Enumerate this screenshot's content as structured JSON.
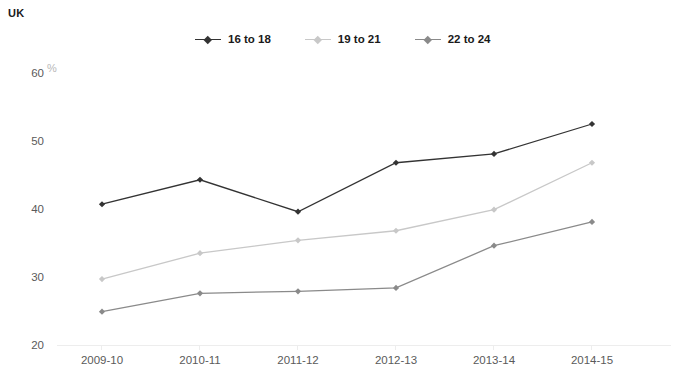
{
  "region": {
    "label": "UK"
  },
  "axis": {
    "unit_label": "%"
  },
  "legend": {
    "items": [
      {
        "label": "16 to 18",
        "color": "#333333"
      },
      {
        "label": "19 to 21",
        "color": "#c8c8c8"
      },
      {
        "label": "22 to 24",
        "color": "#8a8a8a"
      }
    ]
  },
  "chart_data": {
    "type": "line",
    "title": "",
    "subtitle": "",
    "xlabel": "",
    "ylabel": "%",
    "categories": [
      "2009-10",
      "2010-11",
      "2011-12",
      "2012-13",
      "2013-14",
      "2014-15"
    ],
    "series": [
      {
        "name": "16 to 18",
        "color": "#333333",
        "values": [
          40.7,
          44.3,
          39.6,
          46.8,
          48.1,
          52.5
        ]
      },
      {
        "name": "19 to 21",
        "color": "#c8c8c8",
        "values": [
          29.7,
          33.5,
          35.4,
          36.8,
          39.9,
          46.8
        ]
      },
      {
        "name": "22 to 24",
        "color": "#8a8a8a",
        "values": [
          24.9,
          27.6,
          27.9,
          28.4,
          34.6,
          38.1
        ]
      }
    ],
    "ylim": [
      20,
      60
    ],
    "yticks": [
      20,
      30,
      40,
      50,
      60
    ],
    "ytick_labels": [
      "20",
      "30",
      "40",
      "50",
      "60"
    ],
    "grid": false,
    "legend_position": "top-center",
    "marker": "diamond"
  }
}
